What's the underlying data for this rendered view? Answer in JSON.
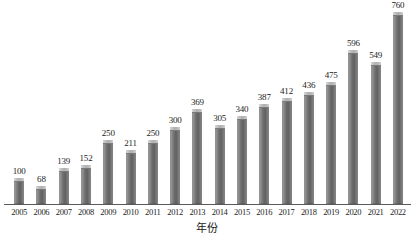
{
  "chart_data": {
    "type": "bar",
    "title": "",
    "subtitle": "",
    "xlabel": "年份",
    "ylabel": "",
    "grid": false,
    "legend": null,
    "ylim": [
      0,
      760
    ],
    "categories": [
      "2005",
      "2006",
      "2007",
      "2008",
      "2009",
      "2010",
      "2011",
      "2012",
      "2013",
      "2014",
      "2015",
      "2016",
      "2017",
      "2018",
      "2019",
      "2020",
      "2021",
      "2022"
    ],
    "values": [
      100,
      68,
      139,
      152,
      250,
      211,
      250,
      300,
      369,
      305,
      340,
      387,
      412,
      436,
      475,
      596,
      549,
      760
    ],
    "value_labels": [
      "100",
      "68",
      "139",
      "152",
      "250",
      "211",
      "250",
      "300",
      "369",
      "305",
      "340",
      "387",
      "412",
      "436",
      "475",
      "596",
      "549",
      "760"
    ],
    "series": [
      {
        "name": "",
        "values": [
          100,
          68,
          139,
          152,
          250,
          211,
          250,
          300,
          369,
          305,
          340,
          387,
          412,
          436,
          475,
          596,
          549,
          760
        ]
      }
    ]
  },
  "style": {
    "background": "#ffffff",
    "bar_color_dark": "#616161",
    "bar_color_light": "#b9b9b9",
    "bar_cap_color": "#c3c3c3",
    "axis_color": "#5a5a5a",
    "text_color": "#232323"
  }
}
